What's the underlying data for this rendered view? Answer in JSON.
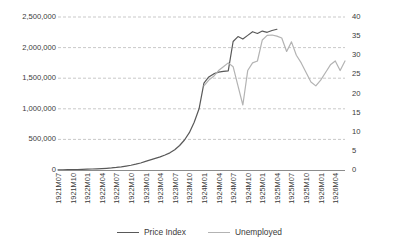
{
  "chart_data": {
    "type": "line",
    "title": "",
    "xlabel": "",
    "ylabel": "",
    "y2label": "",
    "grid": true,
    "legend_position": "bottom",
    "axes": {
      "left": {
        "min": 0,
        "max": 2500000,
        "step": 500000,
        "ticks": [
          "0",
          "500,000",
          "1,000,000",
          "1,500,000",
          "2,000,000",
          "2,500,000"
        ]
      },
      "right": {
        "min": 0,
        "max": 40,
        "step": 5,
        "ticks": [
          "0",
          "5",
          "10",
          "15",
          "20",
          "25",
          "30",
          "35",
          "40"
        ]
      }
    },
    "x": [
      "1921M07",
      "1921M08",
      "1921M09",
      "1921M10",
      "1921M11",
      "1921M12",
      "1922M01",
      "1922M02",
      "1922M03",
      "1922M04",
      "1922M05",
      "1922M06",
      "1922M07",
      "1922M08",
      "1922M09",
      "1922M10",
      "1922M11",
      "1922M12",
      "1923M01",
      "1923M02",
      "1923M03",
      "1923M04",
      "1923M05",
      "1923M06",
      "1923M07",
      "1923M08",
      "1923M09",
      "1923M10",
      "1923M11",
      "1923M12",
      "1924M01",
      "1924M02",
      "1924M03",
      "1924M04",
      "1924M05",
      "1924M06",
      "1924M07",
      "1924M08",
      "1924M09",
      "1924M10",
      "1924M11",
      "1924M12",
      "1925M01",
      "1925M02",
      "1925M03",
      "1925M04",
      "1925M05",
      "1925M06",
      "1925M07",
      "1925M08",
      "1925M09",
      "1925M10",
      "1925M11",
      "1925M12",
      "1926M01",
      "1926M02",
      "1926M03",
      "1926M04",
      "1926M05",
      "1926M06"
    ],
    "xtick_labels": [
      "1921M07",
      "1921M10",
      "1922M01",
      "1922M04",
      "1922M07",
      "1922M10",
      "1923M01",
      "1923M04",
      "1923M07",
      "1923M10",
      "1924M01",
      "1924M04",
      "1924M07",
      "1924M10",
      "1925M01",
      "1925M04",
      "1925M07",
      "1925M10",
      "1926M01",
      "1926M04"
    ],
    "xtick_indices": [
      0,
      3,
      6,
      9,
      12,
      15,
      18,
      21,
      24,
      27,
      30,
      33,
      36,
      39,
      42,
      45,
      48,
      51,
      54,
      57
    ],
    "series": [
      {
        "name": "Price Index",
        "axis": "left",
        "color": "#595959",
        "values": [
          2000,
          3000,
          4500,
          6000,
          8000,
          10000,
          13000,
          16000,
          19000,
          23000,
          28000,
          34000,
          42000,
          52000,
          64000,
          78000,
          95000,
          115000,
          140000,
          165000,
          190000,
          215000,
          245000,
          280000,
          330000,
          400000,
          490000,
          610000,
          780000,
          1000000,
          1420000,
          1520000,
          1570000,
          1600000,
          1610000,
          1620000,
          2100000,
          2180000,
          2140000,
          2200000,
          2260000,
          2230000,
          2270000,
          2250000,
          2280000,
          2300000,
          null,
          null,
          null,
          null,
          null,
          null,
          null,
          null,
          null,
          null,
          null,
          null,
          null,
          null
        ]
      },
      {
        "name": "Unemployed",
        "axis": "right",
        "color": "#b3b3b3",
        "values": [
          null,
          null,
          null,
          null,
          null,
          null,
          null,
          null,
          null,
          null,
          null,
          null,
          null,
          null,
          null,
          null,
          null,
          null,
          null,
          null,
          null,
          null,
          null,
          null,
          null,
          null,
          null,
          null,
          null,
          null,
          22.0,
          23.5,
          24.5,
          26.0,
          27.0,
          28.0,
          27.0,
          22.0,
          17.0,
          26.0,
          28.0,
          28.5,
          34.0,
          35.2,
          35.3,
          35.0,
          34.5,
          31.0,
          33.5,
          30.0,
          28.0,
          25.5,
          23.0,
          22.0,
          23.5,
          25.5,
          27.5,
          28.5,
          26.0,
          28.5
        ]
      }
    ]
  },
  "legend": {
    "items": [
      {
        "label": "Price Index",
        "color": "#595959"
      },
      {
        "label": "Unemployed",
        "color": "#b3b3b3"
      }
    ]
  }
}
